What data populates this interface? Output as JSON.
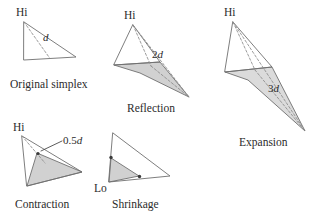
{
  "figure": {
    "background_color": "#ffffff",
    "line_color": "#6f6f6f",
    "shade_color": "#c9c9c9",
    "text_color": "#2b2b2b"
  },
  "panels": [
    {
      "id": "original-simplex",
      "caption": "Original simplex",
      "vertex_label": "Hi",
      "measure_prefix": "",
      "measure_symbol": "d"
    },
    {
      "id": "reflection",
      "caption": "Reflection",
      "vertex_label": "Hi",
      "measure_prefix": "2",
      "measure_symbol": "d"
    },
    {
      "id": "expansion",
      "caption": "Expansion",
      "vertex_label": "Hi",
      "measure_prefix": "3",
      "measure_symbol": "d"
    },
    {
      "id": "contraction",
      "caption": "Contraction",
      "vertex_label": "Hi",
      "measure_prefix": "0.5",
      "measure_symbol": "d"
    },
    {
      "id": "shrinkage",
      "caption": "Shrinkage",
      "vertex_label": "Lo",
      "measure_prefix": "",
      "measure_symbol": ""
    }
  ]
}
